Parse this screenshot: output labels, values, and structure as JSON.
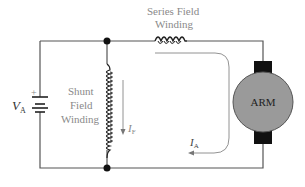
{
  "diagram": {
    "labels": {
      "series_field_line1": "Series Field",
      "series_field_line2": "Winding",
      "shunt_field_line1": "Shunt",
      "shunt_field_line2": "Field",
      "shunt_field_line3": "Winding",
      "supply_voltage": "V",
      "supply_voltage_sub": "A",
      "battery_plus": "+",
      "field_current": "I",
      "field_current_sub": "F",
      "armature_current": "I",
      "armature_current_sub": "A",
      "armature": "ARM"
    },
    "colors": {
      "wire": "#555555",
      "armature_fill": "#9a9a9a",
      "brush": "#111111",
      "label": "#8a8a8a"
    }
  }
}
